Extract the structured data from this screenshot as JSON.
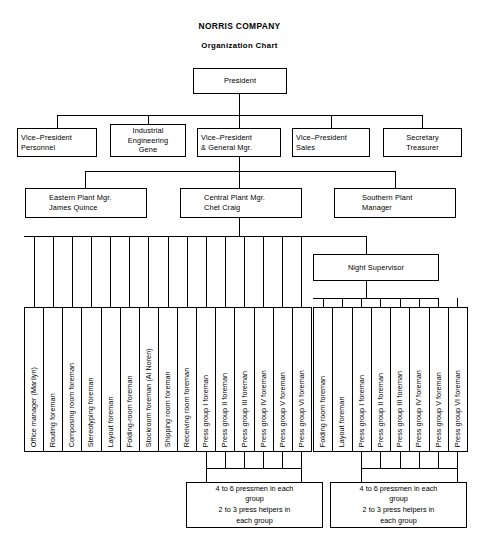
{
  "header": {
    "company": "NORRIS COMPANY",
    "subtitle": "Organization Chart"
  },
  "nodes": {
    "president": "President",
    "vp_personnel": "Vice–President\nPersonnel",
    "industrial_eng": "Industrial\nEngineering\nGene",
    "vp_general_mgr": "Vice–President\n& General Mgr.",
    "vp_sales": "Vice–President\nSales",
    "secretary_treasurer": "Secretary\nTreasurer",
    "eastern_plant": "Eastern Plant Mgr.\nJames Quince",
    "central_plant": "Central Plant Mgr.\nChet Craig",
    "southern_plant": "Southern Plant\nManager",
    "night_supervisor": "Night Supervisor"
  },
  "day_shift_columns": [
    "Office manager (Marilyn)",
    "Routing foreman",
    "Composing room foreman",
    "Stereotyping foreman",
    "Layout foreman",
    "Folding-room foreman",
    "Stockroom foreman (Al Noren)",
    "Shipping room foreman",
    "Receiving room foreman",
    "Press group I foreman",
    "Press group II foreman",
    "Press group III foreman",
    "Press group IV foreman",
    "Press group V foreman",
    "Press group VI foreman"
  ],
  "night_shift_columns": [
    "Folding room foreman",
    "Layout foreman",
    "Press group I foreman",
    "Press group II foreman",
    "Press group III foreman",
    "Press group IV foreman",
    "Press group V foreman",
    "Press group VI foreman"
  ],
  "notes": {
    "day_note": "4 to 6 pressmen in each\ngroup\n2 to 3 press helpers in\neach group",
    "night_note": "4 to 6 pressmen in each\ngroup\n2 to 3 press helpers in\neach group"
  },
  "style": {
    "line_color": "#000000",
    "background": "#ffffff"
  }
}
